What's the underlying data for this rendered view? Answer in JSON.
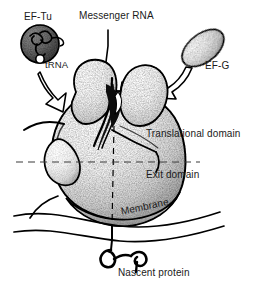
{
  "figure": {
    "background_color": "#ffffff",
    "ink_color": "#000000"
  },
  "labels": {
    "ef_tu": "EF-Tu",
    "trna": "tRNA",
    "messenger_rna": "Messenger RNA",
    "ef_g": "EF-G",
    "translational_domain": "Translational domain",
    "exit_domain": "Exit domain",
    "membrane": "Membrane",
    "nascent_protein": "Nascent protein"
  },
  "elements": {
    "ribosome": "ribosome-body",
    "ef_tu_complex": "ef-tu-trna-complex",
    "ef_g_particle": "ef-g-particle",
    "mrna_strand": "messenger-rna-strand",
    "nascent_chain": "nascent-protein-chain",
    "membrane_bilayer": "membrane-lines",
    "domain_divider": "horizontal-dashed-divider",
    "vertical_divider": "vertical-dashed-divider",
    "arrow_ef_tu": "ef-tu-entry-arrow",
    "arrow_ef_g": "ef-g-entry-arrow"
  }
}
